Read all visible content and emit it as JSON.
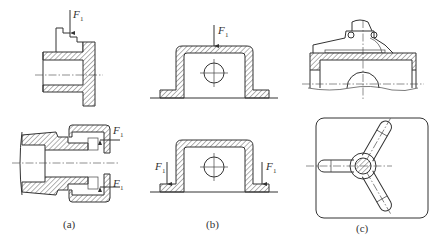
{
  "figure": {
    "panels": [
      {
        "id": "a",
        "caption": "(a)",
        "force_label": "F",
        "force_subscript": "1",
        "views": [
          "stepped-sleeve-cross-section",
          "collet-nut-assembly-cross-section"
        ]
      },
      {
        "id": "b",
        "caption": "(b)",
        "force_label": "F",
        "force_subscript": "1",
        "views": [
          "housing-load-on-top",
          "housing-load-on-flanges"
        ]
      },
      {
        "id": "c",
        "caption": "(c)",
        "views": [
          "clamp-fixture-side-section",
          "three-arm-spider-top-view"
        ]
      }
    ]
  }
}
